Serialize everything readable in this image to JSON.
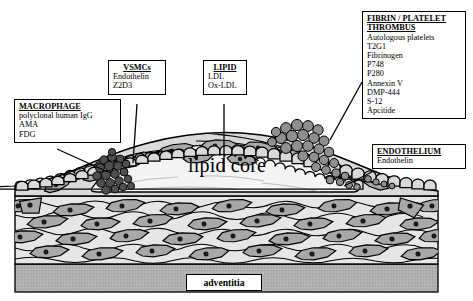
{
  "figure": {
    "lipid_core_label": "lipid core",
    "adventitia_label": "adventitia"
  },
  "colors": {
    "outline": "#000000",
    "media_fill": "#e6e6e6",
    "cell_fill": "#a8a8a8",
    "cell_nucleus": "#1a1a1a",
    "cap_fill": "#d9d9d9",
    "lipid_core_fill": "#f2f2f2",
    "thrombus_fill": "#9a9a9a",
    "macrophage_fill": "#5a5a5a",
    "adventitia_fill": "#b5b5b5",
    "callout_bg": "#ffffff"
  },
  "callouts": [
    {
      "id": "macrophage",
      "header": "MACROPHAGE",
      "items": [
        "polyclonal human IgG",
        "AMA",
        "FDG"
      ]
    },
    {
      "id": "vsmcs",
      "header": "VSMCs",
      "items": [
        "Endothelin",
        "Z2D3"
      ]
    },
    {
      "id": "lipid",
      "header": "LIPID",
      "items": [
        "LDL",
        "Ox-LDL"
      ]
    },
    {
      "id": "thrombus",
      "header": "FIBRIN / PLATELET THROMBUS",
      "header_line1": "FIBRIN / PLATELET",
      "header_line2": "THROMBUS",
      "items": [
        "Autologous platelets",
        "T2G1",
        "Fibrinogen",
        "P748",
        "P280",
        "Annexin V",
        "DMP-444",
        "S-12",
        "Apcitide"
      ]
    },
    {
      "id": "endothelium",
      "header": "ENDOTHELIUM",
      "items": [
        "Endothelin"
      ]
    }
  ]
}
